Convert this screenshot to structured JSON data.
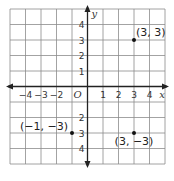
{
  "chart_data": {
    "type": "scatter",
    "title": "",
    "xlabel": "x",
    "ylabel": "y",
    "origin_label": "O",
    "xlim": [
      -5,
      5
    ],
    "ylim": [
      -5,
      5
    ],
    "grid": true,
    "x_ticks": [
      -4,
      -3,
      -2,
      1,
      2,
      3,
      4
    ],
    "x_tick_labels": [
      "−4",
      "−3",
      "−2",
      "1",
      "2",
      "3",
      "4"
    ],
    "y_ticks": [
      4,
      3,
      2,
      1,
      -2,
      -3,
      -4
    ],
    "y_tick_labels": [
      "4",
      "3",
      "2",
      "1",
      "2",
      "3",
      "4"
    ],
    "points": [
      {
        "x": 3,
        "y": 3,
        "label": "(3, 3)"
      },
      {
        "x": -1,
        "y": -3,
        "label": "(−1, −3)"
      },
      {
        "x": 3,
        "y": -3,
        "label": "(3, −3)"
      }
    ]
  },
  "colors": {
    "grid": "#8c8c8c",
    "axis": "#222222",
    "point": "#111111"
  }
}
